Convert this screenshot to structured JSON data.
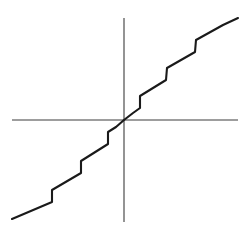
{
  "figure": {
    "title": "",
    "caption": "",
    "background_color": "#ffffff",
    "axis_color": "#3c3c3c",
    "curve_color": "#1a1a1a",
    "style": "hand-drawn"
  },
  "chart_data": {
    "type": "line",
    "title": "",
    "subtitle": "",
    "xlabel": "",
    "ylabel": "",
    "xlim": [
      -5.5,
      5.5
    ],
    "ylim": [
      -5.5,
      5.5
    ],
    "grid": false,
    "legend": false,
    "legend_position": "none",
    "description": "Hand-drawn staircase-like monotone increasing curve passing through the origin, antisymmetric about the origin; alternating gentle treads and steep risers",
    "annotations": [],
    "tick_labels": {
      "x": [],
      "y": []
    },
    "axes": [
      {
        "name": "x-axis",
        "orientation": "horizontal",
        "from": [
          -5.2,
          0
        ],
        "to": [
          5.1,
          0
        ]
      },
      {
        "name": "y-axis",
        "orientation": "vertical",
        "from": [
          0,
          5.1
        ],
        "to": [
          0,
          -5.1
        ]
      }
    ],
    "series": [
      {
        "name": "staircase",
        "x": [
          -5.2,
          -4.0,
          -4.0,
          -3.0,
          -2.9,
          -1.9,
          -1.8,
          -1.0,
          -0.9,
          0.0,
          0.9,
          1.0,
          1.8,
          1.9,
          2.9,
          3.0,
          4.0,
          4.0,
          5.1
        ],
        "y": [
          -4.95,
          -4.15,
          -3.0,
          -2.2,
          -1.0,
          -0.2,
          0.0,
          0.0,
          0.0,
          0.0,
          0.0,
          0.0,
          0.0,
          0.2,
          1.0,
          2.2,
          3.0,
          4.15,
          4.95
        ],
        "points_px": [
          [
            12,
            219
          ],
          [
            52,
            202
          ],
          [
            52,
            190
          ],
          [
            81,
            173
          ],
          [
            81,
            161
          ],
          [
            108,
            144
          ],
          [
            108,
            132
          ],
          [
            116,
            127
          ],
          [
            124,
            120
          ],
          [
            133,
            113
          ],
          [
            140,
            108
          ],
          [
            140,
            96
          ],
          [
            166,
            80
          ],
          [
            167,
            68
          ],
          [
            195,
            52
          ],
          [
            196,
            40
          ],
          [
            223,
            25
          ],
          [
            238,
            18
          ]
        ],
        "step_count": 5
      }
    ]
  }
}
